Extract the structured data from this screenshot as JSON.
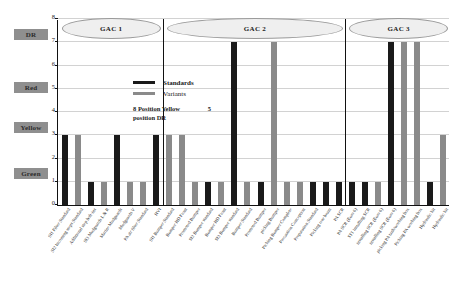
{
  "chart_data": {
    "type": "bar",
    "title": "",
    "xlabel": "",
    "ylabel": "",
    "ylim": [
      0,
      8
    ],
    "ytick_values": [
      0,
      1,
      2,
      3,
      4,
      5,
      6,
      7,
      8
    ],
    "grid": true,
    "legend_position": "inside-top-left",
    "legend": [
      {
        "name": "Standards",
        "color": "#1a1a1a"
      },
      {
        "name": "Variants",
        "color": "#8a8a8a"
      }
    ],
    "annotation_line1": "8 Position  Yellow",
    "annotation_value": "5",
    "annotation_line2": "position  DR",
    "groups": [
      {
        "label": "GAC 1",
        "start": 0,
        "end": 8
      },
      {
        "label": "GAC 2",
        "start": 8,
        "end": 22
      },
      {
        "label": "GAC 3",
        "start": 22,
        "end": 30
      }
    ],
    "categories": [
      "SI1 Filter Standard",
      "SI2 Incoming steps Standard",
      "Additional step bolt-ins",
      "SI3 Mudguards L & R",
      "Marine Mudguards",
      "Mudguards V",
      "PA air filter Standard",
      "HVI",
      "SI1 Bumper Standard",
      "Bumper HD Front",
      "Promoted Bumper",
      "SI2 Bumper standard",
      "Bumper HD Front",
      "SI3 Bumper standard",
      "Bumper Standard",
      "Promoted Bumper",
      "picking Bumper",
      "Picking Bumper Complete",
      "Precaution Conception",
      "Preparation Standard",
      "Picking rear beam",
      "PA SCR",
      "PA SCR (Euro 6)",
      "ST1 installing SCR",
      "installing SCR (Euro 6)",
      "installing SCR (Euro 6)",
      "picking PA tank/working box",
      "Picking PA working box",
      "Hydraulic kit",
      "Hydraulic kit"
    ],
    "series": [
      {
        "name": "Standards",
        "color": "#1a1a1a",
        "values": [
          3,
          null,
          1,
          null,
          3,
          null,
          1,
          3,
          null,
          7,
          null,
          1,
          null,
          1,
          null,
          1,
          null,
          1,
          null,
          1,
          null,
          1,
          null,
          7,
          null,
          null,
          1,
          null,
          null,
          null
        ]
      },
      {
        "name": "Variants",
        "color": "#8a8a8a",
        "values": [
          null,
          3,
          null,
          1,
          null,
          1,
          null,
          null,
          3,
          null,
          7,
          null,
          1,
          null,
          1,
          null,
          1,
          null,
          1,
          null,
          1,
          null,
          1,
          null,
          7,
          7,
          null,
          1,
          3,
          null
        ]
      }
    ],
    "bars": [
      {
        "i": 0,
        "v": 3,
        "s": "Standards"
      },
      {
        "i": 1,
        "v": 3,
        "s": "Variants"
      },
      {
        "i": 2,
        "v": 1,
        "s": "Standards"
      },
      {
        "i": 3,
        "v": 1,
        "s": "Variants"
      },
      {
        "i": 4,
        "v": 3,
        "s": "Standards"
      },
      {
        "i": 5,
        "v": 1,
        "s": "Variants"
      },
      {
        "i": 6,
        "v": 1,
        "s": "Variants"
      },
      {
        "i": 7,
        "v": 3,
        "s": "Standards"
      },
      {
        "i": 8,
        "v": 3,
        "s": "Variants"
      },
      {
        "i": 9,
        "v": 3,
        "s": "Variants"
      },
      {
        "i": 10,
        "v": 1,
        "s": "Variants"
      },
      {
        "i": 11,
        "v": 1,
        "s": "Standards"
      },
      {
        "i": 12,
        "v": 1,
        "s": "Variants"
      },
      {
        "i": 13,
        "v": 7,
        "s": "Standards"
      },
      {
        "i": 14,
        "v": 1,
        "s": "Variants"
      },
      {
        "i": 15,
        "v": 1,
        "s": "Standards"
      },
      {
        "i": 16,
        "v": 7,
        "s": "Variants"
      },
      {
        "i": 17,
        "v": 1,
        "s": "Variants"
      },
      {
        "i": 18,
        "v": 1,
        "s": "Variants"
      },
      {
        "i": 19,
        "v": 1,
        "s": "Standards"
      },
      {
        "i": 20,
        "v": 1,
        "s": "Standards"
      },
      {
        "i": 21,
        "v": 1,
        "s": "Standards"
      },
      {
        "i": 22,
        "v": 1,
        "s": "Standards"
      },
      {
        "i": 23,
        "v": 1,
        "s": "Standards"
      },
      {
        "i": 24,
        "v": 1,
        "s": "Variants"
      },
      {
        "i": 25,
        "v": 7,
        "s": "Standards"
      },
      {
        "i": 26,
        "v": 7,
        "s": "Variants"
      },
      {
        "i": 27,
        "v": 7,
        "s": "Variants"
      },
      {
        "i": 28,
        "v": 1,
        "s": "Standards"
      },
      {
        "i": 29,
        "v": 3,
        "s": "Variants"
      }
    ]
  },
  "side_labels": [
    {
      "text": "DR",
      "top": 29
    },
    {
      "text": "Red",
      "top": 82
    },
    {
      "text": "Yellow",
      "top": 122
    },
    {
      "text": "Green",
      "top": 168
    }
  ],
  "colors": {
    "standards": "#1a1a1a",
    "variants": "#8a8a8a",
    "side_label_bg": "#8f8f8f",
    "grid": "#d2d2d2",
    "axis": "#111111",
    "gac_fill": "#efefef"
  }
}
